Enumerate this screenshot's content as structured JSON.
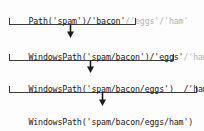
{
  "diagram": {
    "colors": {
      "background": "#fdfdfd",
      "text": "#1b1b1b",
      "pending_text": "#b4b4b4",
      "bracket": "#3a3a3a",
      "arrow": "#1b1b1b"
    },
    "steps": [
      {
        "id": "step-1",
        "active": "Path('spam')/'bacon'",
        "pending": "/'eggs'/'ham'"
      },
      {
        "id": "step-2",
        "active": "WindowsPath('spam/bacon')/'eggs'",
        "pending": "/'ham'"
      },
      {
        "id": "step-3",
        "active": "WindowsPath('spam/bacon/eggs')  /'ham'",
        "pending": ""
      },
      {
        "id": "step-4",
        "active": "WindowsPath('spam/bacon/eggs/ham')",
        "pending": ""
      }
    ],
    "connectors": [
      {
        "id": "connector-1",
        "from": "step-1",
        "to": "step-2"
      },
      {
        "id": "connector-2",
        "from": "step-2",
        "to": "step-3"
      },
      {
        "id": "connector-3",
        "from": "step-3",
        "to": "step-4"
      }
    ]
  }
}
